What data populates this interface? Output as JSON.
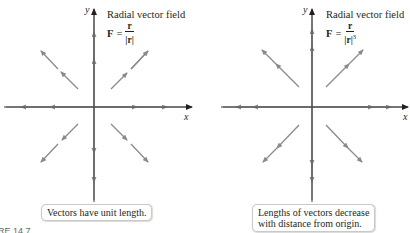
{
  "figure_label": "RE 14.7",
  "panels": [
    {
      "title": "Radial vector field",
      "formula": {
        "lhs": "F",
        "eq": "=",
        "numerator": "r",
        "denominator": "|r|",
        "exponent": ""
      },
      "axis_x": "x",
      "axis_y": "y",
      "note": [
        "Vectors have unit length."
      ]
    },
    {
      "title": "Radial vector field",
      "formula": {
        "lhs": "F",
        "eq": "=",
        "numerator": "r",
        "denominator": "|r|",
        "exponent": "3"
      },
      "axis_x": "x",
      "axis_y": "y",
      "note": [
        "Lengths of vectors decrease",
        "with distance from origin."
      ]
    }
  ],
  "colors": {
    "axis": "#231f20",
    "vector": "#8a8a8a",
    "note_border": "#c9c9c9"
  }
}
